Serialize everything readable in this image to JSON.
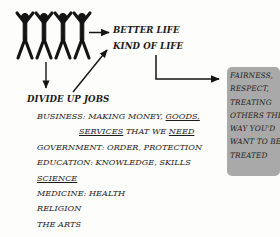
{
  "diagram": {
    "title_hidden": "",
    "figures": {
      "label": "four people holding raised hands",
      "count": 4,
      "color": "#141414"
    },
    "outcomes": {
      "better_life": "BETTER LIFE",
      "kind_of_life": "KIND OF LIFE"
    },
    "branch": {
      "heading": "DIVIDE UP JOBS"
    },
    "jobs": [
      {
        "id": "business",
        "indent": false,
        "segments": [
          {
            "text": "BUSINESS: MAKING MONEY, ",
            "underline": false
          },
          {
            "text": "GOODS,",
            "underline": true
          }
        ]
      },
      {
        "id": "business-cont",
        "indent": true,
        "segments": [
          {
            "text": "SERVICES",
            "underline": true
          },
          {
            "text": " THAT WE ",
            "underline": false
          },
          {
            "text": "NEED",
            "underline": true
          }
        ]
      },
      {
        "id": "government",
        "indent": false,
        "segments": [
          {
            "text": "GOVERNMENT: ORDER, PROTECTION",
            "underline": false
          }
        ]
      },
      {
        "id": "education",
        "indent": false,
        "segments": [
          {
            "text": "EDUCATION: KNOWLEDGE, SKILLS",
            "underline": false
          }
        ]
      },
      {
        "id": "science",
        "indent": false,
        "segments": [
          {
            "text": "SCIENCE",
            "underline": true
          }
        ]
      },
      {
        "id": "medicine",
        "indent": false,
        "segments": [
          {
            "text": "MEDICINE: HEALTH",
            "underline": false
          }
        ]
      },
      {
        "id": "religion",
        "indent": false,
        "segments": [
          {
            "text": "RELIGION",
            "underline": false
          }
        ]
      },
      {
        "id": "the-arts",
        "indent": false,
        "segments": [
          {
            "text": "THE ARTS",
            "underline": false
          }
        ]
      }
    ],
    "callout": {
      "background_color": "#a9a9a9",
      "lines": [
        "FAIRNESS,",
        "RESPECT,",
        "TREATING",
        "OTHERS THE",
        "WAY YOU'D",
        "WANT TO BE",
        "TREATED"
      ]
    },
    "connectors": [
      {
        "id": "figures-to-better-life",
        "kind": "arrow-right"
      },
      {
        "id": "jobs-to-kind-of-life",
        "kind": "arrow-diagonal-up-right"
      },
      {
        "id": "figures-to-divide-up-jobs",
        "kind": "arrow-down"
      },
      {
        "id": "kind-of-life-to-callout",
        "kind": "elbow-arrow-right"
      }
    ],
    "ink_color": "#141414"
  }
}
